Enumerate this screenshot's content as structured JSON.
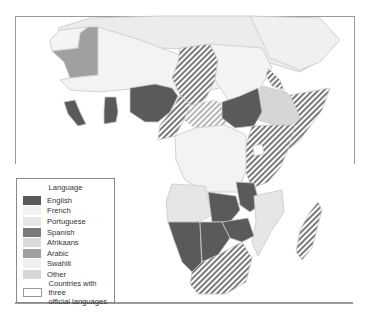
{
  "legend": {
    "title": "Language",
    "items": [
      {
        "label": "English",
        "color": "#5a5a5a"
      },
      {
        "label": "French",
        "color": "#f2f2f2"
      },
      {
        "label": "Portuguese",
        "color": "#e6e6e6"
      },
      {
        "label": "Spanish",
        "color": "#7a7a7a"
      },
      {
        "label": "Afrikaans",
        "color": "#dadada"
      },
      {
        "label": "Arabic",
        "color": "#a0a0a0"
      },
      {
        "label": "Swahili",
        "color": "#efefef"
      },
      {
        "label": "Other",
        "color": "#d6d6d6"
      }
    ],
    "three_languages": {
      "label_line1": "Countries with three",
      "label_line2": "official languages",
      "pattern": "diagonal-hatch"
    }
  },
  "colors": {
    "border": "#c8c8c8",
    "hatch": "#7a7a7a",
    "ocean": "#ffffff"
  }
}
